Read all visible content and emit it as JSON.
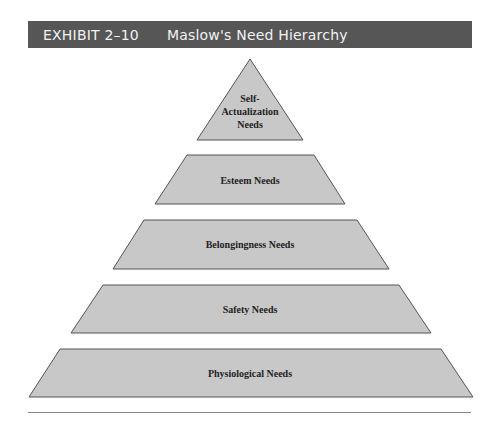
{
  "header": {
    "exhibit": "EXHIBIT 2–10",
    "title": "Maslow's Need Hierarchy"
  },
  "pyramid": {
    "fill": "#c8c8c8",
    "stroke": "#555555",
    "levels": [
      {
        "name": "self-actualization",
        "lines": [
          "Self-",
          "Actualization",
          "Needs"
        ]
      },
      {
        "name": "esteem",
        "label": "Esteem Needs"
      },
      {
        "name": "belongingness",
        "label": "Belongingness Needs"
      },
      {
        "name": "safety",
        "label": "Safety Needs"
      },
      {
        "name": "physiological",
        "label": "Physiological Needs"
      }
    ]
  }
}
